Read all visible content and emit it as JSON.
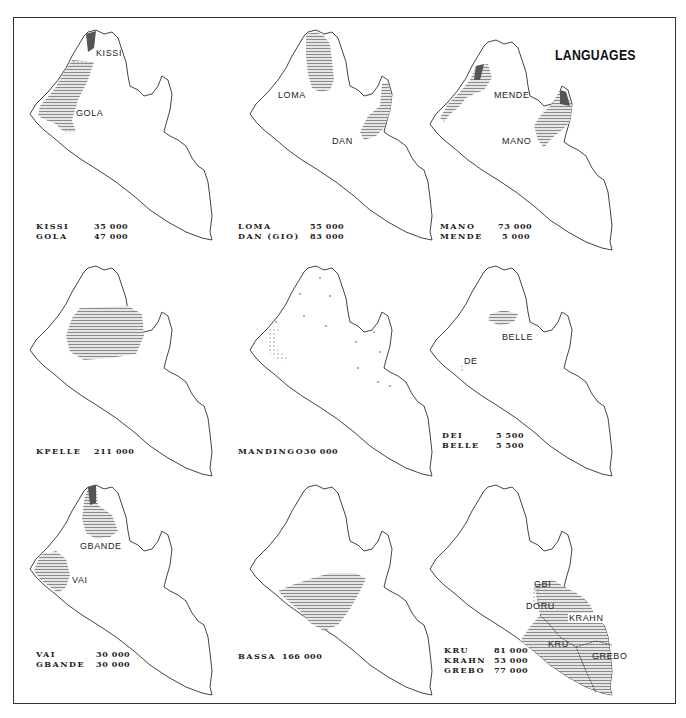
{
  "title": "LANGUAGES",
  "colors": {
    "outline": "#444444",
    "fill_dark": "#555555",
    "fill_hatch": "#9a9a9a",
    "fill_light": "#c8c8c8",
    "frame": "#333333"
  },
  "panels": [
    {
      "id": "kissi-gola",
      "labels": [
        "KISSI",
        "GOLA"
      ],
      "legend": [
        {
          "name": "KISSI",
          "count": "35 000"
        },
        {
          "name": "GOLA",
          "count": "47 000"
        }
      ]
    },
    {
      "id": "loma-dan",
      "labels": [
        "LOMA",
        "DAN"
      ],
      "legend": [
        {
          "name": "LOMA",
          "count": "55 000"
        },
        {
          "name": "DAN (GIO)",
          "count": "83 000"
        }
      ]
    },
    {
      "id": "mano-mende",
      "labels": [
        "MENDE",
        "MANO"
      ],
      "legend": [
        {
          "name": "MANO",
          "count": "73 000"
        },
        {
          "name": "MENDE",
          "count": "5 000"
        }
      ]
    },
    {
      "id": "kpelle",
      "labels": [],
      "legend": [
        {
          "name": "KPELLE",
          "count": "211 000"
        }
      ]
    },
    {
      "id": "mandingo",
      "labels": [],
      "legend": [
        {
          "name": "MANDINGO",
          "count": "30 000"
        }
      ]
    },
    {
      "id": "dei-belle",
      "labels": [
        "BELLE",
        "DE"
      ],
      "legend": [
        {
          "name": "DEI",
          "count": "5 500"
        },
        {
          "name": "BELLE",
          "count": "5 500"
        }
      ]
    },
    {
      "id": "vai-gbande",
      "labels": [
        "GBANDE",
        "VAI"
      ],
      "legend": [
        {
          "name": "VAI",
          "count": "30 000"
        },
        {
          "name": "GBANDE",
          "count": "30 000"
        }
      ]
    },
    {
      "id": "bassa",
      "labels": [],
      "legend": [
        {
          "name": "BASSA",
          "count": "166 000"
        }
      ]
    },
    {
      "id": "kru-krahn-grebo",
      "labels": [
        "GBI",
        "DORU",
        "KRAHN",
        "KRU",
        "GREBO"
      ],
      "legend": [
        {
          "name": "KRU",
          "count": "81 000"
        },
        {
          "name": "KRAHN",
          "count": "53 000"
        },
        {
          "name": "GREBO",
          "count": "77 000"
        }
      ]
    }
  ]
}
